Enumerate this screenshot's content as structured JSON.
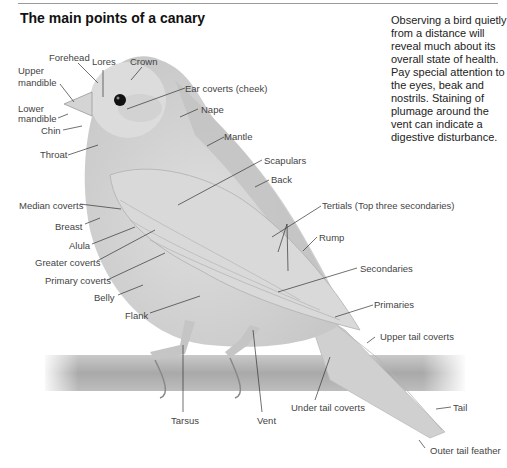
{
  "title": "The main points of a canary",
  "note": "Observing a bird quietly from a distance will reveal much about its overall state of health. Pay special attention to the eyes, beak and nostrils. Staining of plumage around the vent can indicate a digestive disturbance.",
  "labels": {
    "forehead": "Forehead",
    "lores": "Lores",
    "crown": "Crown",
    "upper_mandible_1": "Upper",
    "upper_mandible_2": "mandible",
    "ear_coverts": "Ear coverts (cheek)",
    "lower_mandible_1": "Lower",
    "lower_mandible_2": "mandible",
    "nape": "Nape",
    "chin": "Chin",
    "mantle": "Mantle",
    "throat": "Throat",
    "scapulars": "Scapulars",
    "back": "Back",
    "median_coverts": "Median coverts",
    "tertials": "Tertials (Top three secondaries)",
    "breast": "Breast",
    "rump": "Rump",
    "alula": "Alula",
    "greater_coverts": "Greater coverts",
    "secondaries": "Secondaries",
    "primary_coverts": "Primary coverts",
    "belly": "Belly",
    "primaries": "Primaries",
    "flank": "Flank",
    "upper_tail_coverts": "Upper tail coverts",
    "under_tail_coverts": "Under tail coverts",
    "tail": "Tail",
    "tarsus": "Tarsus",
    "vent": "Vent",
    "outer_tail_feather": "Outer tail feather"
  }
}
